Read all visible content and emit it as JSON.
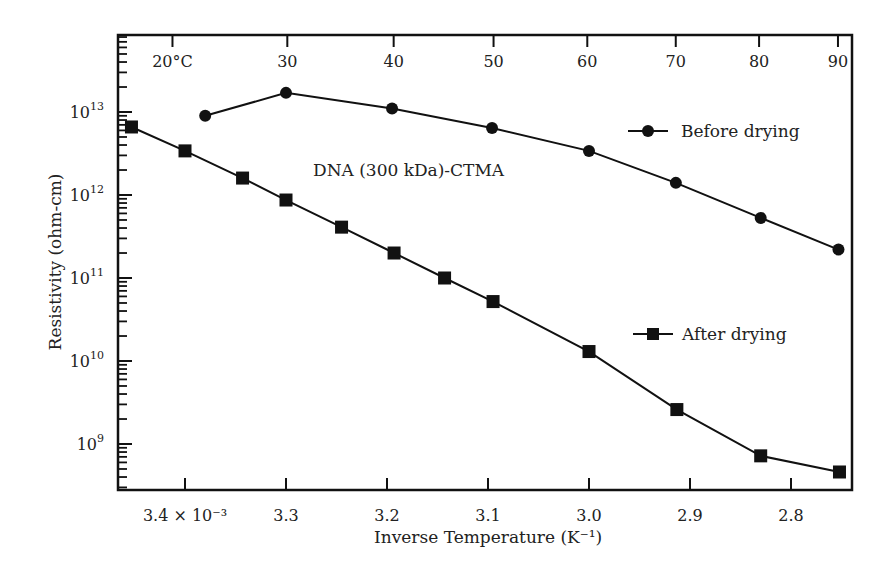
{
  "chart_data": {
    "type": "line",
    "title": "",
    "annotation": "DNA (300 kDa)-CTMA",
    "xlabel": "Inverse Temperature (K⁻¹)",
    "ylabel": "Resistivity (ohm-cm)",
    "yscale": "log",
    "xlim": [
      3.465,
      2.735
    ],
    "ylim": [
      300000000.0,
      60000000000000.0
    ],
    "x_ticks": [
      {
        "value": 3.4,
        "label": "3.4 × 10⁻³"
      },
      {
        "value": 3.3,
        "label": "3.3"
      },
      {
        "value": 3.2,
        "label": "3.2"
      },
      {
        "value": 3.1,
        "label": "3.1"
      },
      {
        "value": 3.0,
        "label": "3.0"
      },
      {
        "value": 2.9,
        "label": "2.9"
      },
      {
        "value": 2.8,
        "label": "2.8"
      }
    ],
    "top_axis_ticks": [
      {
        "value": 3.4124,
        "label": "20°C"
      },
      {
        "value": 3.2987,
        "label": "30"
      },
      {
        "value": 3.1934,
        "label": "40"
      },
      {
        "value": 3.0945,
        "label": "50"
      },
      {
        "value": 3.0017,
        "label": "60"
      },
      {
        "value": 2.9141,
        "label": "70"
      },
      {
        "value": 2.8316,
        "label": "80"
      },
      {
        "value": 2.7535,
        "label": "90"
      }
    ],
    "y_ticks": [
      {
        "exp": 9,
        "label": "10",
        "sup": "9"
      },
      {
        "exp": 10,
        "label": "10",
        "sup": "10"
      },
      {
        "exp": 11,
        "label": "10",
        "sup": "11"
      },
      {
        "exp": 12,
        "label": "10",
        "sup": "12"
      },
      {
        "exp": 13,
        "label": "10",
        "sup": "13"
      }
    ],
    "grid": false,
    "legend_position": "inline-right",
    "series": [
      {
        "name": "Before drying",
        "marker": "circle",
        "x": [
          3.38,
          3.3,
          3.195,
          3.096,
          3.0,
          2.914,
          2.83,
          2.753
        ],
        "y": [
          9000000000000.0,
          17000000000000.0,
          11000000000000.0,
          6400000000000.0,
          3400000000000.0,
          1400000000000.0,
          530000000000.0,
          220000000000.0
        ]
      },
      {
        "name": "After drying",
        "marker": "square",
        "x": [
          3.453,
          3.4,
          3.343,
          3.3,
          3.245,
          3.193,
          3.143,
          3.095,
          3.0,
          2.913,
          2.83,
          2.752
        ],
        "y": [
          6600000000000.0,
          3400000000000.0,
          1600000000000.0,
          870000000000.0,
          410000000000.0,
          200000000000.0,
          100000000000.0,
          52000000000.0,
          13000000000.0,
          2600000000.0,
          720000000.0,
          460000000.0
        ]
      }
    ]
  },
  "legend": {
    "before": "Before drying",
    "after": "After drying"
  },
  "labels": {
    "annotation": "DNA (300 kDa)-CTMA",
    "xlabel": "Inverse Temperature (K⁻¹)",
    "ylabel": "Resistivity (ohm-cm)"
  }
}
